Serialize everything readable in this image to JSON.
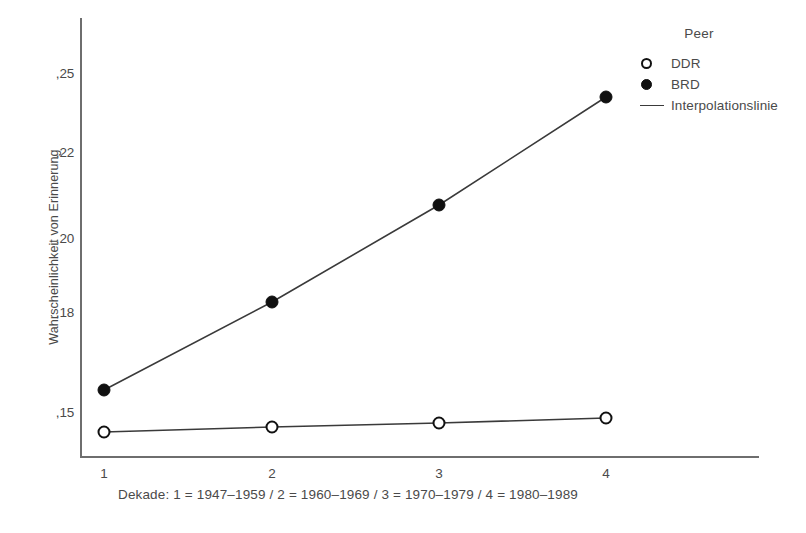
{
  "chart_data": {
    "type": "line",
    "title": "",
    "xlabel": "Dekade: 1 = 1947–1959 / 2 = 1960–1969 / 3 = 1970–1979 / 4 = 1980–1989",
    "ylabel": "Wahrscheinlichkeit von Erinnerung",
    "categories": [
      "1",
      "2",
      "3",
      "4"
    ],
    "x_tick_labels": [
      "1",
      "2",
      "3",
      "4"
    ],
    "y_tick_labels": [
      ",25",
      ",22",
      ",20",
      ",18",
      ",15"
    ],
    "y_tick_values": [
      0.25,
      0.22,
      0.2,
      0.18,
      0.15
    ],
    "ylim": [
      0.133,
      0.257
    ],
    "grid": false,
    "legend_position": "top-right",
    "series": [
      {
        "name": "DDR",
        "marker": "open-circle",
        "values": [
          0.14,
          0.142,
          0.143,
          0.145
        ]
      },
      {
        "name": "BRD",
        "marker": "filled-circle",
        "values": [
          0.155,
          0.185,
          0.212,
          0.242
        ]
      }
    ],
    "annotations": []
  },
  "legend": {
    "title": "Peer",
    "entries": [
      {
        "label": "DDR",
        "marker": "open-circle"
      },
      {
        "label": "BRD",
        "marker": "filled-circle"
      },
      {
        "label": "Interpolationslinie",
        "marker": "line"
      }
    ]
  },
  "axes": {
    "y_title": "Wahrscheinlichkeit von Erinnerung",
    "x_title": "Dekade: 1 = 1947–1959 / 2 = 1960–1969 / 3 = 1970–1979 / 4 = 1980–1989"
  },
  "colors": {
    "line": "#3a3a3a",
    "marker_fill": "#101010",
    "marker_open": "#ffffff",
    "axis": "#6e6e6e",
    "text": "#4a4a4a",
    "background": "#ffffff"
  },
  "geometry": {
    "x_positions": [
      104,
      272,
      439,
      606
    ],
    "y_tick_pixels": [
      73,
      152,
      238,
      312,
      412
    ],
    "series_pixels": {
      "DDR": [
        432,
        427,
        423,
        418
      ],
      "BRD": [
        390,
        302,
        205,
        97
      ]
    }
  }
}
